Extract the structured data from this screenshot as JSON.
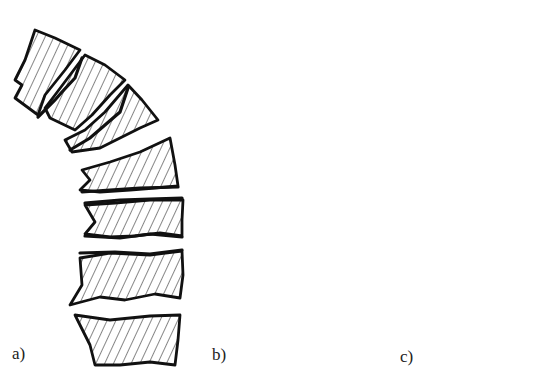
{
  "figure": {
    "panels": [
      {
        "id": "a",
        "label": "a)",
        "vertebrae_count": 7,
        "feature": "narrowed, jagged intervertebral gaps with sclerotic dense endplates"
      },
      {
        "id": "b",
        "label": "b)",
        "vertebrae_count": 7,
        "feature": "biconcave vertebral bodies with enlarged lens-shaped intervertebral discs"
      },
      {
        "id": "c",
        "label": "c)",
        "vertebrae_count": 7,
        "feature": "wedge-shaped anterior vertebrae with narrow slit-like disc spaces"
      }
    ],
    "colors": {
      "ink": "#111111",
      "background": "#ffffff"
    }
  }
}
